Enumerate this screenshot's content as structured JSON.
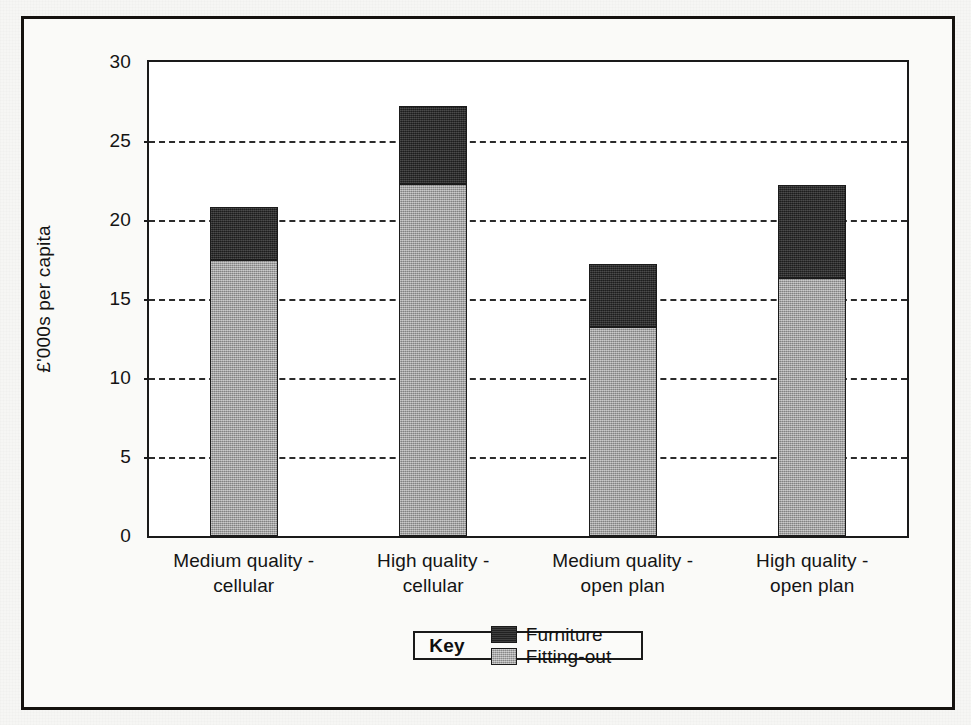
{
  "chart_data": {
    "type": "bar",
    "subtype": "stacked",
    "title": "",
    "xlabel": "",
    "ylabel": "£'000s per capita",
    "ylim": [
      0,
      30
    ],
    "ytick_step": 5,
    "ytick_labels": [
      "0",
      "5",
      "10",
      "15",
      "20",
      "25",
      "30"
    ],
    "ytick_values": [
      0,
      5,
      10,
      15,
      20,
      25,
      30
    ],
    "grid": "horizontal-dashed",
    "legend_position": "bottom",
    "categories": [
      "Medium quality - cellular",
      "High quality - cellular",
      "Medium quality - open plan",
      "High quality - open plan"
    ],
    "category_lines": [
      [
        "Medium quality -",
        "cellular"
      ],
      [
        "High quality -",
        "cellular"
      ],
      [
        "Medium quality -",
        "open plan"
      ],
      [
        "High quality -",
        "open plan"
      ]
    ],
    "series": [
      {
        "name": "Fitting-out",
        "color": "#9d9d9d",
        "values": [
          17.5,
          22.3,
          13.2,
          16.3
        ]
      },
      {
        "name": "Furniture",
        "color": "#282828",
        "values": [
          3.3,
          4.9,
          4.0,
          5.9
        ]
      }
    ],
    "totals": [
      20.8,
      27.2,
      17.2,
      22.2
    ],
    "stack_order_bottom_to_top": [
      "Fitting-out",
      "Furniture"
    ]
  },
  "legend": {
    "key_label": "Key",
    "entries": [
      {
        "label": "Furniture",
        "swatch": "dark-swatch-icon"
      },
      {
        "label": "Fitting-out",
        "swatch": "grey-swatch-icon"
      }
    ]
  },
  "colors": {
    "furniture": "#282828",
    "fitting_out": "#9d9d9d",
    "axis": "#1a1a1a",
    "grid": "#2b2b2b",
    "page": "#f6f6f4"
  }
}
